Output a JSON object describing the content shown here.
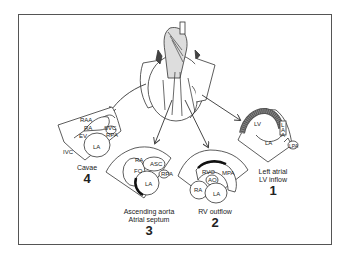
{
  "figure": {
    "center_element": "heart-illustration",
    "views": [
      {
        "number": "1",
        "caption_line1": "Left atrial",
        "caption_line2": "LV inflow",
        "structures": [
          "LV",
          "LA",
          "L",
          "A",
          "A",
          "LPA"
        ]
      },
      {
        "number": "2",
        "caption_line1": "RV outflow",
        "caption_line2": "",
        "structures": [
          "RVO",
          "MPA",
          "AO",
          "RA",
          "LA"
        ]
      },
      {
        "number": "3",
        "caption_line1": "Ascending aorta",
        "caption_line2": "Atrial septum",
        "structures": [
          "RA",
          "ASC",
          "FO",
          "RPA",
          "LA"
        ]
      },
      {
        "number": "4",
        "caption_line1": "Cavae",
        "caption_line2": "",
        "structures": [
          "RAA",
          "RA",
          "SVC",
          "EV",
          "RPA",
          "IVC",
          "LA"
        ]
      }
    ]
  }
}
